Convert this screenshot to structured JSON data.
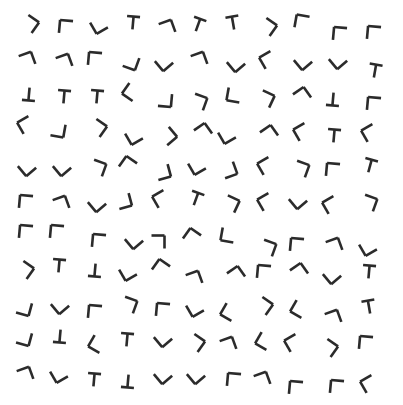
{
  "stimulus": {
    "title": "Visual search array",
    "description": "Randomly rotated L-junction and T-junction line figures on a white field",
    "width": 403,
    "height": 405,
    "background_color": "#ffffff",
    "stroke_color": "#2b2b2b",
    "stroke_width": 2.6,
    "arm_length": 13,
    "item_count": 121,
    "rows": 11,
    "columns": 11,
    "shape_types": [
      "L",
      "T"
    ],
    "chart_data": {
      "type": "scatter",
      "title": "Visual search array",
      "xlabel": "",
      "ylabel": "",
      "xlim": [
        0,
        403
      ],
      "ylim": [
        0,
        405
      ],
      "grid": false,
      "legend": null,
      "items": [
        {
          "x": 30,
          "y": 24,
          "shape": "L",
          "rot": 215
        },
        {
          "x": 66,
          "y": 27,
          "shape": "L",
          "rot": 95
        },
        {
          "x": 99,
          "y": 25,
          "shape": "L",
          "rot": 330
        },
        {
          "x": 133,
          "y": 23,
          "shape": "T",
          "rot": 5
        },
        {
          "x": 167,
          "y": 28,
          "shape": "L",
          "rot": 160
        },
        {
          "x": 198,
          "y": 25,
          "shape": "T",
          "rot": 20
        },
        {
          "x": 233,
          "y": 23,
          "shape": "T",
          "rot": 350
        },
        {
          "x": 268,
          "y": 27,
          "shape": "L",
          "rot": 215
        },
        {
          "x": 302,
          "y": 22,
          "shape": "L",
          "rot": 100
        },
        {
          "x": 340,
          "y": 34,
          "shape": "L",
          "rot": 95
        },
        {
          "x": 374,
          "y": 33,
          "shape": "L",
          "rot": 95
        },
        {
          "x": 27,
          "y": 60,
          "shape": "L",
          "rot": 160
        },
        {
          "x": 64,
          "y": 62,
          "shape": "L",
          "rot": 160
        },
        {
          "x": 95,
          "y": 59,
          "shape": "L",
          "rot": 95
        },
        {
          "x": 131,
          "y": 62,
          "shape": "L",
          "rot": 290
        },
        {
          "x": 164,
          "y": 62,
          "shape": "L",
          "rot": 320
        },
        {
          "x": 199,
          "y": 60,
          "shape": "L",
          "rot": 160
        },
        {
          "x": 236,
          "y": 63,
          "shape": "L",
          "rot": 320
        },
        {
          "x": 268,
          "y": 60,
          "shape": "L",
          "rot": 60
        },
        {
          "x": 303,
          "y": 61,
          "shape": "L",
          "rot": 320
        },
        {
          "x": 338,
          "y": 60,
          "shape": "L",
          "rot": 320
        },
        {
          "x": 375,
          "y": 71,
          "shape": "T",
          "rot": 10
        },
        {
          "x": 29,
          "y": 94,
          "shape": "T",
          "rot": 185
        },
        {
          "x": 64,
          "y": 97,
          "shape": "T",
          "rot": 5
        },
        {
          "x": 97,
          "y": 97,
          "shape": "T",
          "rot": 5
        },
        {
          "x": 131,
          "y": 92,
          "shape": "L",
          "rot": 35
        },
        {
          "x": 165,
          "y": 100,
          "shape": "L",
          "rot": 275
        },
        {
          "x": 199,
          "y": 102,
          "shape": "L",
          "rot": 200
        },
        {
          "x": 234,
          "y": 95,
          "shape": "L",
          "rot": 10
        },
        {
          "x": 266,
          "y": 99,
          "shape": "L",
          "rot": 205
        },
        {
          "x": 302,
          "y": 96,
          "shape": "L",
          "rot": 145
        },
        {
          "x": 333,
          "y": 99,
          "shape": "T",
          "rot": 185
        },
        {
          "x": 374,
          "y": 104,
          "shape": "L",
          "rot": 95
        },
        {
          "x": 26,
          "y": 125,
          "shape": "L",
          "rot": 60
        },
        {
          "x": 58,
          "y": 130,
          "shape": "L",
          "rot": 280
        },
        {
          "x": 98,
          "y": 128,
          "shape": "L",
          "rot": 215
        },
        {
          "x": 134,
          "y": 136,
          "shape": "L",
          "rot": 330
        },
        {
          "x": 168,
          "y": 136,
          "shape": "L",
          "rot": 230
        },
        {
          "x": 203,
          "y": 132,
          "shape": "L",
          "rot": 145
        },
        {
          "x": 227,
          "y": 135,
          "shape": "L",
          "rot": 330
        },
        {
          "x": 269,
          "y": 134,
          "shape": "L",
          "rot": 145
        },
        {
          "x": 302,
          "y": 132,
          "shape": "L",
          "rot": 60
        },
        {
          "x": 334,
          "y": 136,
          "shape": "T",
          "rot": 5
        },
        {
          "x": 370,
          "y": 133,
          "shape": "L",
          "rot": 60
        },
        {
          "x": 27,
          "y": 167,
          "shape": "L",
          "rot": 320
        },
        {
          "x": 62,
          "y": 167,
          "shape": "L",
          "rot": 320
        },
        {
          "x": 98,
          "y": 168,
          "shape": "L",
          "rot": 200
        },
        {
          "x": 128,
          "y": 165,
          "shape": "L",
          "rot": 125
        },
        {
          "x": 163,
          "y": 172,
          "shape": "L",
          "rot": 255
        },
        {
          "x": 197,
          "y": 166,
          "shape": "L",
          "rot": 330
        },
        {
          "x": 229,
          "y": 170,
          "shape": "L",
          "rot": 250
        },
        {
          "x": 266,
          "y": 166,
          "shape": "L",
          "rot": 60
        },
        {
          "x": 301,
          "y": 169,
          "shape": "L",
          "rot": 200
        },
        {
          "x": 333,
          "y": 170,
          "shape": "L",
          "rot": 95
        },
        {
          "x": 370,
          "y": 166,
          "shape": "T",
          "rot": 15
        },
        {
          "x": 26,
          "y": 202,
          "shape": "L",
          "rot": 95
        },
        {
          "x": 61,
          "y": 204,
          "shape": "L",
          "rot": 160
        },
        {
          "x": 97,
          "y": 203,
          "shape": "L",
          "rot": 320
        },
        {
          "x": 124,
          "y": 201,
          "shape": "L",
          "rot": 255
        },
        {
          "x": 161,
          "y": 199,
          "shape": "L",
          "rot": 60
        },
        {
          "x": 196,
          "y": 199,
          "shape": "T",
          "rot": 20
        },
        {
          "x": 231,
          "y": 204,
          "shape": "L",
          "rot": 205
        },
        {
          "x": 266,
          "y": 202,
          "shape": "L",
          "rot": 60
        },
        {
          "x": 298,
          "y": 200,
          "shape": "L",
          "rot": 320
        },
        {
          "x": 331,
          "y": 205,
          "shape": "L",
          "rot": 60
        },
        {
          "x": 369,
          "y": 203,
          "shape": "L",
          "rot": 200
        },
        {
          "x": 26,
          "y": 232,
          "shape": "L",
          "rot": 95
        },
        {
          "x": 57,
          "y": 232,
          "shape": "L",
          "rot": 95
        },
        {
          "x": 99,
          "y": 241,
          "shape": "L",
          "rot": 95
        },
        {
          "x": 134,
          "y": 240,
          "shape": "L",
          "rot": 320
        },
        {
          "x": 158,
          "y": 242,
          "shape": "L",
          "rot": 180
        },
        {
          "x": 192,
          "y": 237,
          "shape": "L",
          "rot": 125
        },
        {
          "x": 228,
          "y": 235,
          "shape": "L",
          "rot": 10
        },
        {
          "x": 268,
          "y": 248,
          "shape": "L",
          "rot": 200
        },
        {
          "x": 297,
          "y": 245,
          "shape": "L",
          "rot": 95
        },
        {
          "x": 334,
          "y": 246,
          "shape": "L",
          "rot": 160
        },
        {
          "x": 368,
          "y": 247,
          "shape": "L",
          "rot": 330
        },
        {
          "x": 25,
          "y": 270,
          "shape": "L",
          "rot": 215
        },
        {
          "x": 59,
          "y": 266,
          "shape": "T",
          "rot": 5
        },
        {
          "x": 95,
          "y": 270,
          "shape": "T",
          "rot": 185
        },
        {
          "x": 128,
          "y": 272,
          "shape": "L",
          "rot": 330
        },
        {
          "x": 161,
          "y": 268,
          "shape": "L",
          "rot": 125
        },
        {
          "x": 194,
          "y": 279,
          "shape": "L",
          "rot": 160
        },
        {
          "x": 236,
          "y": 275,
          "shape": "L",
          "rot": 145
        },
        {
          "x": 264,
          "y": 272,
          "shape": "L",
          "rot": 95
        },
        {
          "x": 299,
          "y": 272,
          "shape": "L",
          "rot": 145
        },
        {
          "x": 332,
          "y": 275,
          "shape": "L",
          "rot": 320
        },
        {
          "x": 369,
          "y": 272,
          "shape": "T",
          "rot": 5
        },
        {
          "x": 24,
          "y": 308,
          "shape": "L",
          "rot": 285
        },
        {
          "x": 60,
          "y": 305,
          "shape": "L",
          "rot": 320
        },
        {
          "x": 95,
          "y": 312,
          "shape": "L",
          "rot": 95
        },
        {
          "x": 129,
          "y": 305,
          "shape": "L",
          "rot": 200
        },
        {
          "x": 163,
          "y": 310,
          "shape": "L",
          "rot": 95
        },
        {
          "x": 195,
          "y": 308,
          "shape": "L",
          "rot": 330
        },
        {
          "x": 229,
          "y": 312,
          "shape": "L",
          "rot": 30
        },
        {
          "x": 264,
          "y": 306,
          "shape": "L",
          "rot": 215
        },
        {
          "x": 299,
          "y": 309,
          "shape": "L",
          "rot": 30
        },
        {
          "x": 333,
          "y": 318,
          "shape": "L",
          "rot": 160
        },
        {
          "x": 369,
          "y": 307,
          "shape": "T",
          "rot": 350
        },
        {
          "x": 24,
          "y": 338,
          "shape": "L",
          "rot": 285
        },
        {
          "x": 60,
          "y": 336,
          "shape": "T",
          "rot": 185
        },
        {
          "x": 97,
          "y": 344,
          "shape": "L",
          "rot": 30
        },
        {
          "x": 127,
          "y": 340,
          "shape": "T",
          "rot": 5
        },
        {
          "x": 163,
          "y": 338,
          "shape": "L",
          "rot": 320
        },
        {
          "x": 196,
          "y": 343,
          "shape": "L",
          "rot": 215
        },
        {
          "x": 228,
          "y": 345,
          "shape": "L",
          "rot": 160
        },
        {
          "x": 264,
          "y": 341,
          "shape": "L",
          "rot": 30
        },
        {
          "x": 293,
          "y": 343,
          "shape": "L",
          "rot": 60
        },
        {
          "x": 329,
          "y": 348,
          "shape": "L",
          "rot": 215
        },
        {
          "x": 366,
          "y": 343,
          "shape": "L",
          "rot": 95
        },
        {
          "x": 25,
          "y": 375,
          "shape": "L",
          "rot": 160
        },
        {
          "x": 59,
          "y": 374,
          "shape": "L",
          "rot": 330
        },
        {
          "x": 94,
          "y": 380,
          "shape": "T",
          "rot": 5
        },
        {
          "x": 128,
          "y": 381,
          "shape": "T",
          "rot": 185
        },
        {
          "x": 163,
          "y": 375,
          "shape": "L",
          "rot": 320
        },
        {
          "x": 196,
          "y": 375,
          "shape": "L",
          "rot": 320
        },
        {
          "x": 234,
          "y": 380,
          "shape": "L",
          "rot": 95
        },
        {
          "x": 262,
          "y": 380,
          "shape": "L",
          "rot": 160
        },
        {
          "x": 296,
          "y": 388,
          "shape": "L",
          "rot": 95
        },
        {
          "x": 337,
          "y": 387,
          "shape": "L",
          "rot": 95
        },
        {
          "x": 369,
          "y": 384,
          "shape": "L",
          "rot": 60
        }
      ]
    }
  }
}
